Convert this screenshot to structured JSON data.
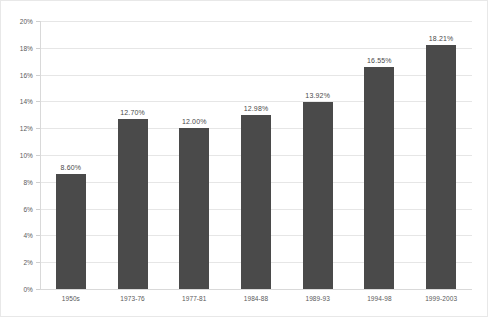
{
  "chart_data": {
    "type": "bar",
    "title": "",
    "subtitle": "",
    "xlabel": "",
    "ylabel": "",
    "ylim": [
      0,
      20
    ],
    "ytick_labels": [
      "20%",
      "18%",
      "16%",
      "14%",
      "12%",
      "10%",
      "8%",
      "6%",
      "4%",
      "2%",
      "0%"
    ],
    "ytick_values": [
      20,
      18,
      16,
      14,
      12,
      10,
      8,
      6,
      4,
      2,
      0
    ],
    "grid": true,
    "legend": "none",
    "bar_color": "#4a4a4a",
    "gridline_color": "#e6e6e6",
    "categories": [
      "1950s",
      "1973-76",
      "1977-81",
      "1984-88",
      "1989-93",
      "1994-98",
      "1999-2003"
    ],
    "values": [
      8.6,
      12.7,
      12.0,
      12.98,
      13.92,
      16.55,
      18.21
    ],
    "data_labels": [
      "8.60%",
      "12.70%",
      "12.00%",
      "12.98%",
      "13.92%",
      "16.55%",
      "18.21%"
    ]
  }
}
